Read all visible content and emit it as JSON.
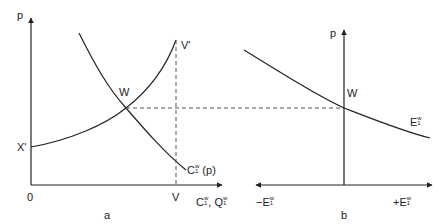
{
  "panel_a": {
    "caption": "a",
    "y_axis_label": "p",
    "origin_label": "0",
    "x_axis_label_main": "C",
    "x_axis_label_sep": ", ",
    "x_axis_label_main2": "Q",
    "super": "w",
    "sub": "1",
    "label_X_prime": "X'",
    "label_V_prime": "V'",
    "label_V": "V",
    "label_W": "W",
    "demand_curve_label_main": "C",
    "demand_curve_label_arg": " (p)"
  },
  "panel_b": {
    "caption": "b",
    "y_axis_label": "p",
    "label_W": "W",
    "curve_label_main": "E",
    "left_axis_label_main": "−E",
    "right_axis_label_main": "+E",
    "super": "w",
    "sub": "1"
  },
  "colors": {
    "line": "#222222",
    "dash": "#555555"
  }
}
